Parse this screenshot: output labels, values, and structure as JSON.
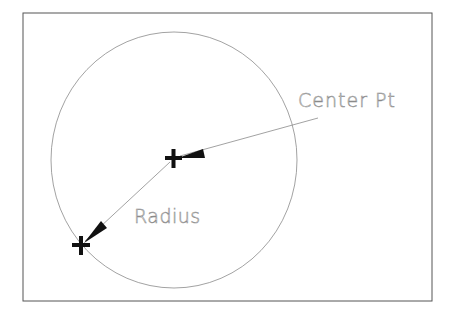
{
  "diagram": {
    "type": "cad-circle-center-radius",
    "labels": {
      "center": "Center Pt",
      "radius": "Radius"
    },
    "colors": {
      "background": "#ffffff",
      "frame": "#555555",
      "circle": "#8a8a8a",
      "leader": "#8a8a8a",
      "marker": "#111111",
      "text": "#8a8a8a"
    },
    "points": {
      "center": {
        "x": 173,
        "y": 158
      },
      "radius_point": {
        "x": 81,
        "y": 245
      }
    }
  }
}
